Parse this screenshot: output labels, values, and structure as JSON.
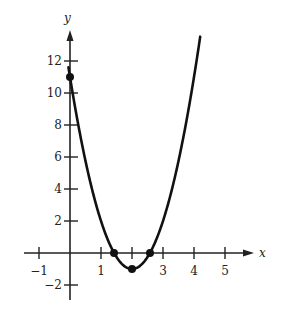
{
  "chart_data": {
    "type": "line",
    "title": "",
    "xlabel": "x",
    "ylabel": "y",
    "xlim": [
      -1.5,
      6.2
    ],
    "ylim": [
      -3,
      13.5
    ],
    "grid": false,
    "x_ticks": [
      -1,
      1,
      2,
      3,
      4,
      5
    ],
    "x_tick_labels": [
      "−1",
      "1",
      "",
      "3",
      "4",
      "5"
    ],
    "y_ticks": [
      -2,
      2,
      4,
      6,
      8,
      10,
      12
    ],
    "y_tick_labels": [
      "−2",
      "2",
      "4",
      "6",
      "8",
      "10",
      "12"
    ],
    "series": [
      {
        "name": "y = 3x² − 12x + 11",
        "function": {
          "a": 3,
          "b": -12,
          "c": 11
        },
        "x_range": [
          -0.05,
          4.2
        ],
        "color": "#111111"
      }
    ],
    "points": [
      {
        "label": "y-intercept",
        "x": 0,
        "y": 11
      },
      {
        "label": "root-1",
        "x": 1.42,
        "y": 0
      },
      {
        "label": "vertex",
        "x": 2,
        "y": -1
      },
      {
        "label": "root-2",
        "x": 2.58,
        "y": 0
      }
    ]
  }
}
